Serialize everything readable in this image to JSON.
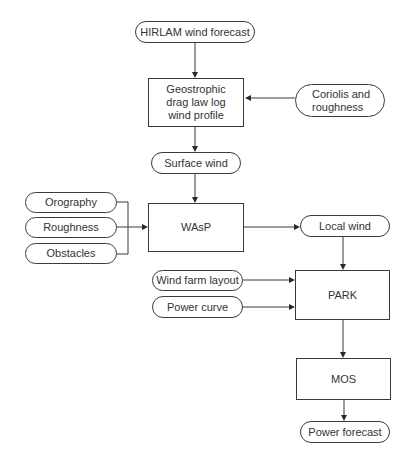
{
  "diagram": {
    "nodes": {
      "hirlam": {
        "label": "HIRLAM wind forecast",
        "shape": "terminal"
      },
      "geostrophic": {
        "label": "Geostrophic\ndrag law log\nwind profile",
        "shape": "process"
      },
      "coriolis": {
        "label": "Coriolis and\nroughness",
        "shape": "terminal"
      },
      "surface_wind": {
        "label": "Surface wind",
        "shape": "terminal"
      },
      "orography": {
        "label": "Orography",
        "shape": "terminal"
      },
      "roughness": {
        "label": "Roughness",
        "shape": "terminal"
      },
      "obstacles": {
        "label": "Obstacles",
        "shape": "terminal"
      },
      "wasp": {
        "label": "WAsP",
        "shape": "process"
      },
      "local_wind": {
        "label": "Local wind",
        "shape": "terminal"
      },
      "wind_farm_layout": {
        "label": "Wind farm layout",
        "shape": "terminal"
      },
      "power_curve": {
        "label": "Power curve",
        "shape": "terminal"
      },
      "park": {
        "label": "PARK",
        "shape": "process"
      },
      "mos": {
        "label": "MOS",
        "shape": "process"
      },
      "power_forecast": {
        "label": "Power forecast",
        "shape": "terminal"
      }
    },
    "edges": [
      {
        "from": "HIRLAM wind forecast",
        "to": "Geostrophic drag law log wind profile"
      },
      {
        "from": "Coriolis and roughness",
        "to": "Geostrophic drag law log wind profile"
      },
      {
        "from": "Geostrophic drag law log wind profile",
        "to": "Surface wind"
      },
      {
        "from": "Surface wind",
        "to": "WAsP"
      },
      {
        "from": "Orography",
        "to": "WAsP"
      },
      {
        "from": "Roughness",
        "to": "WAsP"
      },
      {
        "from": "Obstacles",
        "to": "WAsP"
      },
      {
        "from": "WAsP",
        "to": "Local wind"
      },
      {
        "from": "Local wind",
        "to": "PARK"
      },
      {
        "from": "Wind farm layout",
        "to": "PARK"
      },
      {
        "from": "Power curve",
        "to": "PARK"
      },
      {
        "from": "PARK",
        "to": "MOS"
      },
      {
        "from": "MOS",
        "to": "Power forecast"
      }
    ],
    "colors": {
      "stroke": "#3a3a3a",
      "text": "#333333",
      "background": "#ffffff"
    }
  }
}
